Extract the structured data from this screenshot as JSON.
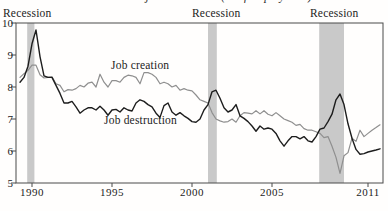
{
  "title_cropped": "Job creation and job destruction (% of employment)",
  "chart_data": {
    "type": "line",
    "title": "Job creation and job destruction (% of employment)",
    "xlabel": "",
    "ylabel": "",
    "ylim": [
      5,
      10
    ],
    "xlim": [
      1989.2,
      2011.9
    ],
    "yticks": [
      10,
      9,
      8,
      7,
      6,
      5
    ],
    "xticks": [
      1990,
      1995,
      2000,
      2005,
      2011
    ],
    "grid": false,
    "legend_position": "inline-labels",
    "x_start": 1989.25,
    "x_step": 0.25,
    "series": [
      {
        "name": "Job creation",
        "color": "#8f8f8f",
        "values": [
          8.3,
          8.42,
          8.52,
          8.68,
          8.68,
          8.38,
          8.28,
          8.3,
          8.32,
          8.1,
          8.05,
          7.85,
          7.92,
          7.9,
          7.95,
          8.05,
          8.0,
          8.12,
          8.15,
          8.0,
          8.4,
          8.15,
          8.0,
          8.2,
          8.2,
          8.15,
          8.3,
          8.37,
          8.35,
          8.3,
          8.1,
          8.45,
          8.45,
          8.4,
          8.3,
          8.1,
          8.15,
          8.1,
          8.0,
          8.05,
          7.9,
          7.95,
          7.9,
          7.88,
          7.75,
          7.6,
          7.55,
          7.5,
          7.2,
          7.0,
          6.94,
          6.9,
          6.92,
          7.0,
          6.9,
          7.1,
          7.2,
          7.18,
          7.16,
          7.26,
          7.16,
          7.26,
          7.15,
          7.1,
          7.2,
          7.1,
          7.0,
          6.95,
          6.9,
          6.8,
          6.83,
          6.7,
          6.65,
          6.65,
          6.6,
          6.55,
          6.42,
          6.45,
          6.15,
          5.8,
          5.3,
          5.85,
          5.95,
          6.4,
          6.3,
          6.65,
          6.45,
          6.55,
          6.65,
          6.73,
          6.82
        ]
      },
      {
        "name": "Job destruction",
        "color": "#1d1d1d",
        "values": [
          8.15,
          8.3,
          8.65,
          9.35,
          9.78,
          8.95,
          8.35,
          8.3,
          8.3,
          8.05,
          7.8,
          7.5,
          7.5,
          7.55,
          7.38,
          7.18,
          7.28,
          7.35,
          7.35,
          7.28,
          7.4,
          7.28,
          7.12,
          7.28,
          7.3,
          7.22,
          7.35,
          7.28,
          7.25,
          7.5,
          7.6,
          7.55,
          7.45,
          7.38,
          7.18,
          7.05,
          7.42,
          7.5,
          7.22,
          7.12,
          7.2,
          7.1,
          7.02,
          6.92,
          6.9,
          7.0,
          7.28,
          7.45,
          7.85,
          7.9,
          7.65,
          7.35,
          7.22,
          7.28,
          7.45,
          7.1,
          7.02,
          6.92,
          6.78,
          6.62,
          6.78,
          6.68,
          6.72,
          6.68,
          6.55,
          6.32,
          6.15,
          6.32,
          6.45,
          6.45,
          6.38,
          6.45,
          6.32,
          6.28,
          6.45,
          6.68,
          6.72,
          6.92,
          7.15,
          7.6,
          7.78,
          7.45,
          6.85,
          6.4,
          6.05,
          5.9,
          5.92,
          5.97,
          6.0,
          6.03,
          6.07
        ]
      }
    ],
    "recession_bands": [
      {
        "from": 1989.7,
        "to": 1990.15
      },
      {
        "from": 2001.0,
        "to": 2001.55
      },
      {
        "from": 2007.95,
        "to": 2009.5
      }
    ],
    "recession_labels": [
      "Recession",
      "Recession",
      "Recession"
    ],
    "colors": {
      "band": "#c9c9c9",
      "axis": "#4a4a4a",
      "text": "#1a1a1a",
      "creation_line": "#8f8f8f",
      "destruction_line": "#1d1d1d"
    }
  }
}
